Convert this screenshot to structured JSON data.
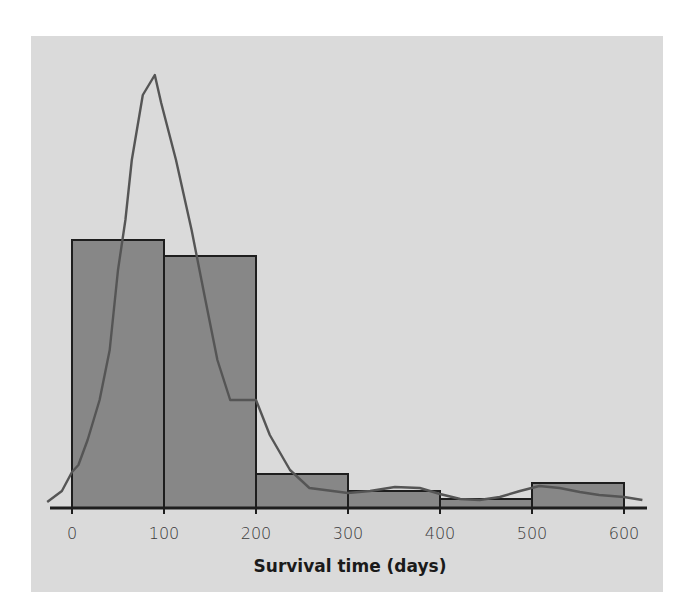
{
  "chart_data": {
    "type": "bar",
    "subtype": "histogram_with_density_curve",
    "title": "",
    "xlabel": "Survival time (days)",
    "ylabel": "",
    "x_ticks": [
      0,
      100,
      200,
      300,
      400,
      500,
      600
    ],
    "x_tick_labels": [
      "0",
      "100",
      "200",
      "300",
      "400",
      "500",
      "600"
    ],
    "xlim": [
      -27,
      620
    ],
    "bins": [
      {
        "start": 0,
        "end": 100,
        "height": 268
      },
      {
        "start": 100,
        "end": 200,
        "height": 252
      },
      {
        "start": 200,
        "end": 300,
        "height": 34
      },
      {
        "start": 300,
        "end": 400,
        "height": 17
      },
      {
        "start": 400,
        "end": 500,
        "height": 9
      },
      {
        "start": 500,
        "end": 600,
        "height": 25
      }
    ],
    "categories": [
      "0-100",
      "100-200",
      "200-300",
      "300-400",
      "400-500",
      "500-600"
    ],
    "values": [
      268,
      252,
      34,
      17,
      9,
      25
    ],
    "ylim": [
      0,
      440
    ],
    "y_units_note": "relative frequency (unlabeled axis); values in relative pixel units",
    "density_curve": {
      "x": [
        -27,
        -11,
        0,
        7,
        17,
        30,
        41,
        50,
        58,
        65,
        77,
        90,
        97,
        113,
        130,
        145,
        158,
        172,
        200,
        215,
        237,
        258,
        300,
        324,
        351,
        378,
        400,
        422,
        443,
        465,
        487,
        508,
        530,
        552,
        573,
        600,
        620
      ],
      "y": [
        6,
        17,
        36,
        43,
        68,
        108,
        158,
        238,
        288,
        348,
        413,
        433,
        405,
        348,
        278,
        208,
        148,
        108,
        108,
        73,
        38,
        20,
        15,
        17,
        21,
        20,
        14,
        9,
        8,
        11,
        17,
        22,
        20,
        16,
        13,
        11,
        8
      ]
    },
    "legend": [],
    "grid": false,
    "colors": {
      "background": "#dadada",
      "bar_fill": "#878787",
      "bar_stroke": "#1e1e1e",
      "curve": "#555555",
      "axis": "#1e1e1e"
    }
  },
  "axis": {
    "x_title": "Survival time (days)",
    "tick_labels": [
      "0",
      "100",
      "200",
      "300",
      "400",
      "500",
      "600"
    ]
  }
}
